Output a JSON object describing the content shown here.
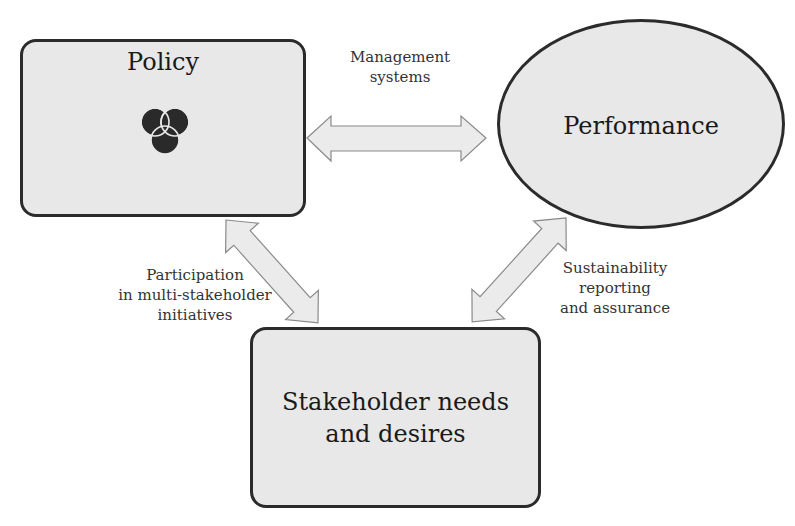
{
  "nodes": {
    "policy": {
      "title": "Policy",
      "icon": "venn-triad-icon"
    },
    "performance": {
      "title": "Performance"
    },
    "stakeholder": {
      "title_line1": "Stakeholder needs",
      "title_line2": "and desires"
    }
  },
  "connectors": {
    "policy_performance": {
      "line1": "Management",
      "line2": "systems"
    },
    "policy_stakeholder": {
      "line1": "Participation",
      "line2": "in multi-stakeholder",
      "line3": "initiatives"
    },
    "performance_stakeholder": {
      "line1": "Sustainability",
      "line2": "reporting",
      "line3": "and assurance"
    }
  },
  "colors": {
    "node_fill": "#e8e8e8",
    "node_border": "#2b2b2b",
    "arrow_fill": "#ebebeb",
    "arrow_stroke": "#8a8a8a",
    "icon_fill": "#2a2a2a"
  }
}
